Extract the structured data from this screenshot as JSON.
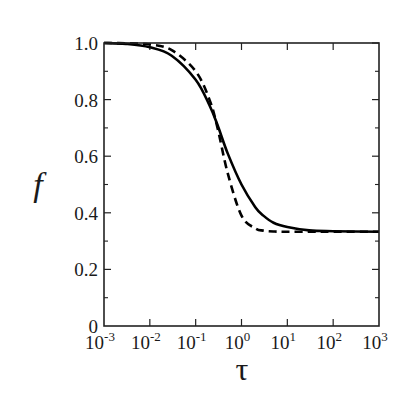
{
  "chart_data": {
    "type": "line",
    "title": "",
    "xlabel": "τ",
    "ylabel": "f",
    "xscale": "log",
    "xlim": [
      0.001,
      1000
    ],
    "ylim": [
      0,
      1.0
    ],
    "grid": false,
    "legend": null,
    "x_ticks": [
      {
        "exp": "-3",
        "value": 0.001
      },
      {
        "exp": "-2",
        "value": 0.01
      },
      {
        "exp": "-1",
        "value": 0.1
      },
      {
        "exp": "0",
        "value": 1
      },
      {
        "exp": "1",
        "value": 10
      },
      {
        "exp": "2",
        "value": 100
      },
      {
        "exp": "3",
        "value": 1000
      }
    ],
    "y_ticks": [
      {
        "label": "0",
        "value": 0
      },
      {
        "label": "0.2",
        "value": 0.2
      },
      {
        "label": "0.4",
        "value": 0.4
      },
      {
        "label": "0.6",
        "value": 0.6
      },
      {
        "label": "0.8",
        "value": 0.8
      },
      {
        "label": "1.0",
        "value": 1.0
      }
    ],
    "y_minor_ticks": [
      0.1,
      0.3,
      0.5,
      0.7,
      0.9
    ],
    "series": [
      {
        "name": "solid",
        "style": "solid",
        "color": "#000000",
        "x": [
          0.001,
          0.003,
          0.01,
          0.03,
          0.1,
          0.2,
          0.3,
          0.5,
          1,
          2,
          3,
          5,
          10,
          30,
          100,
          1000
        ],
        "y": [
          1.0,
          0.997,
          0.985,
          0.955,
          0.87,
          0.78,
          0.71,
          0.61,
          0.5,
          0.42,
          0.39,
          0.365,
          0.35,
          0.338,
          0.335,
          0.333
        ]
      },
      {
        "name": "dashed",
        "style": "dashed",
        "color": "#000000",
        "x": [
          0.001,
          0.003,
          0.01,
          0.03,
          0.1,
          0.2,
          0.3,
          0.5,
          1,
          2,
          3,
          5,
          10,
          30,
          100,
          1000
        ],
        "y": [
          1.0,
          0.999,
          0.995,
          0.975,
          0.9,
          0.8,
          0.7,
          0.54,
          0.39,
          0.345,
          0.337,
          0.334,
          0.333,
          0.333,
          0.333,
          0.333
        ]
      }
    ]
  }
}
